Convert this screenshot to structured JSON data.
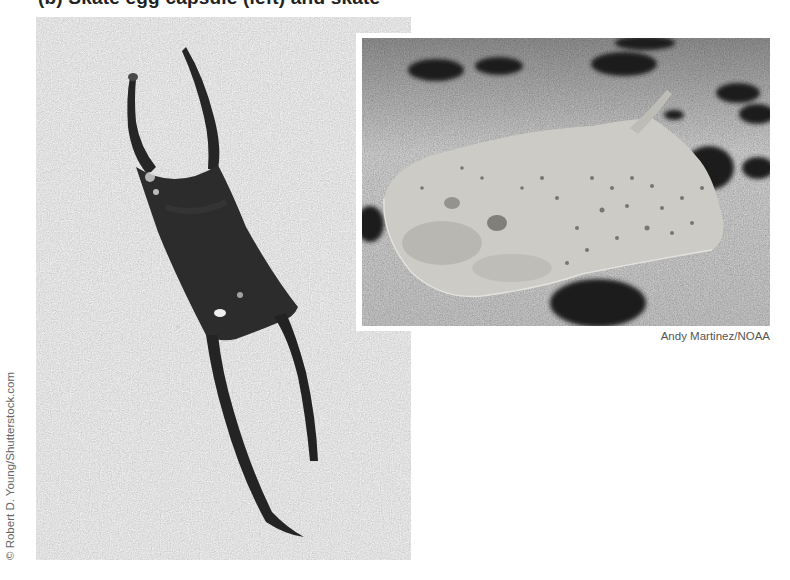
{
  "figure": {
    "title": "(b) Skate egg capsule (left) and skate",
    "photos": [
      {
        "id": "left",
        "subject": "egg-capsule",
        "credit": "© Robert D. Young/Shutterstock.com",
        "background_color": "#bcbcbc",
        "subject_color": "#2a2a2a"
      },
      {
        "id": "right",
        "subject": "skate",
        "credit": "Andy Martinez/NOAA",
        "background_color": "#8e8e8e",
        "subject_color": "#c9c7c2"
      }
    ]
  }
}
